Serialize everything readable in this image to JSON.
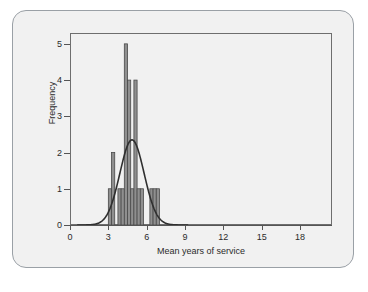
{
  "bleed_through": {
    "top_text": "",
    "bottom_text": ""
  },
  "chart_data": {
    "type": "bar",
    "title": "",
    "subtitle": "",
    "xlabel": "Mean years of service",
    "ylabel": "Frequency",
    "xlim": [
      0,
      20.5
    ],
    "ylim": [
      0,
      5.3
    ],
    "xticks": [
      0,
      3,
      6,
      9,
      12,
      15,
      18
    ],
    "xtick_labels": [
      "0",
      "3",
      "6",
      "9",
      "12",
      "15",
      "18"
    ],
    "yticks": [
      0,
      1,
      2,
      3,
      4,
      5
    ],
    "ytick_labels": [
      "0",
      "1",
      "2",
      "3",
      "4",
      "5"
    ],
    "grid": false,
    "legend": null,
    "bar_color": "#8f8f8f",
    "bar_edge_color": "#4a4a4a",
    "curve_color": "#2f2f2f",
    "frame_color": "#6e6e6e",
    "background_color": "#f1f1f1",
    "bin_width": 0.25,
    "bins": [
      {
        "x": 3.0,
        "frequency": 1
      },
      {
        "x": 3.25,
        "frequency": 2
      },
      {
        "x": 3.5,
        "frequency": 0
      },
      {
        "x": 3.75,
        "frequency": 1
      },
      {
        "x": 4.0,
        "frequency": 1
      },
      {
        "x": 4.25,
        "frequency": 5
      },
      {
        "x": 4.5,
        "frequency": 4
      },
      {
        "x": 4.75,
        "frequency": 1
      },
      {
        "x": 5.0,
        "frequency": 4
      },
      {
        "x": 5.25,
        "frequency": 1
      },
      {
        "x": 5.5,
        "frequency": 1
      },
      {
        "x": 5.75,
        "frequency": 0
      },
      {
        "x": 6.0,
        "frequency": 0
      },
      {
        "x": 6.25,
        "frequency": 1
      },
      {
        "x": 6.5,
        "frequency": 1
      },
      {
        "x": 6.75,
        "frequency": 1
      }
    ],
    "normal_curve": {
      "shown": true,
      "mean": 4.85,
      "std_dev": 0.95,
      "peak_frequency": 2.35,
      "x_start": 0.6,
      "x_end": 9.2
    }
  }
}
